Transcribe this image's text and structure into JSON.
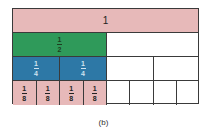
{
  "colors": {
    "whole": "#e7b9b9",
    "half": "#2f9a5a",
    "quarter": "#2d78a6",
    "eighth": "#e7b9b9",
    "empty": "#ffffff",
    "border": "#3a3a3a"
  },
  "rows": [
    {
      "name": "whole",
      "label": "1",
      "filled": 1,
      "parts": 1
    },
    {
      "name": "halves",
      "num": "1",
      "den": "2",
      "filled": 1,
      "parts": 2
    },
    {
      "name": "quarters",
      "num": "1",
      "den": "4",
      "filled": 2,
      "parts": 4
    },
    {
      "name": "eighths",
      "num": "1",
      "den": "8",
      "filled": 4,
      "parts": 8
    }
  ],
  "caption": "(b)"
}
